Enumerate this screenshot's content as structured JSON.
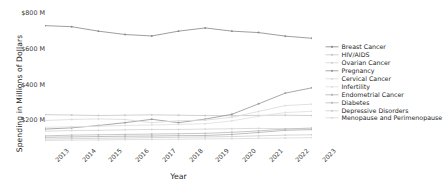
{
  "chart_data": {
    "type": "line",
    "title": "",
    "xlabel": "Year",
    "ylabel": "Spending in Millions of Dollars",
    "x": [
      2013,
      2014,
      2015,
      2016,
      2017,
      2018,
      2019,
      2020,
      2021,
      2022,
      2023
    ],
    "categories": [
      "2013",
      "2014",
      "2015",
      "2016",
      "2017",
      "2018",
      "2019",
      "2020",
      "2021",
      "2022",
      "2023"
    ],
    "xtick_labels": [
      "2013",
      "2014",
      "2015",
      "2016",
      "2017",
      "2018",
      "2019",
      "2020",
      "2021",
      "2022",
      "2023"
    ],
    "ytick_labels": [
      "$200 M",
      "$400 M",
      "$600 M",
      "$800 M"
    ],
    "ytick_values": [
      200,
      400,
      600,
      800
    ],
    "ylim": [
      55,
      830
    ],
    "xlim": [
      2013,
      2023
    ],
    "grid": false,
    "legend_position": "right",
    "legend_frame": false,
    "units": "Millions of Dollars",
    "series": [
      {
        "name": "Breast Cancer",
        "color": "#8c8c8c",
        "values": [
          731,
          725,
          700,
          681,
          673,
          700,
          718,
          700,
          692,
          672,
          660
        ]
      },
      {
        "name": "HIV/AIDS",
        "color": "#c9c9c9",
        "values": [
          231,
          229,
          226,
          228,
          230,
          228,
          226,
          225,
          227,
          228,
          226
        ]
      },
      {
        "name": "Ovarian Cancer",
        "color": "#d4d4d4",
        "values": [
          138,
          142,
          143,
          146,
          148,
          148,
          150,
          152,
          154,
          152,
          150
        ]
      },
      {
        "name": "Pregnancy",
        "color": "#9a9a9a",
        "values": [
          150,
          157,
          170,
          186,
          205,
          186,
          206,
          233,
          292,
          352,
          382
        ]
      },
      {
        "name": "Cervical Cancer",
        "color": "#dcdcdc",
        "values": [
          198,
          204,
          207,
          204,
          186,
          197,
          200,
          216,
          249,
          282,
          290
        ]
      },
      {
        "name": "Infertility",
        "color": "#e0e0e0",
        "values": [
          160,
          163,
          166,
          170,
          173,
          176,
          180,
          196,
          222,
          243,
          250
        ]
      },
      {
        "name": "Endometrial Cancer",
        "color": "#b5b5b5",
        "values": [
          104,
          106,
          108,
          110,
          111,
          113,
          114,
          120,
          131,
          143,
          147
        ]
      },
      {
        "name": "Diabetes",
        "color": "#bdbdbd",
        "values": [
          112,
          116,
          118,
          120,
          122,
          124,
          126,
          132,
          140,
          150,
          156
        ]
      },
      {
        "name": "Depressive Disorders",
        "color": "#d0d0d0",
        "values": [
          94,
          96,
          98,
          100,
          102,
          104,
          106,
          108,
          112,
          116,
          118
        ]
      },
      {
        "name": "Menopause and Perimenopause",
        "color": "#dadada",
        "values": [
          86,
          88,
          89,
          91,
          92,
          93,
          95,
          96,
          98,
          100,
          102
        ]
      }
    ]
  }
}
